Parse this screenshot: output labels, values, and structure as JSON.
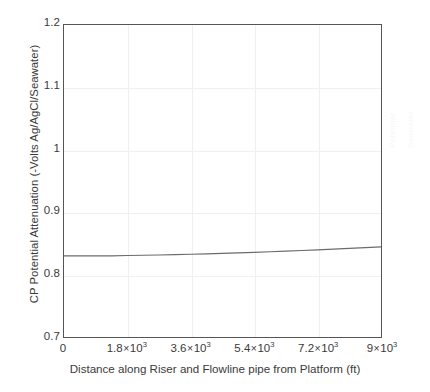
{
  "chart_data": {
    "type": "line",
    "title": "",
    "xlabel": "Distance along Riser and Flowline pipe from Platform (ft)",
    "ylabel": "CP Potential Attenuation (-Volts Ag/AgCl/Seawater)",
    "xlim": [
      0,
      9000
    ],
    "ylim": [
      0.7,
      1.2
    ],
    "grid": true,
    "legend": "none",
    "xticks": [
      0,
      1800,
      3600,
      5400,
      7200,
      9000
    ],
    "xtick_labels": [
      {
        "mantissa": "0",
        "has_exponent": false,
        "exponent": "",
        "value": 0
      },
      {
        "mantissa": "1.8",
        "has_exponent": true,
        "exponent": "3",
        "value": 1800
      },
      {
        "mantissa": "3.6",
        "has_exponent": true,
        "exponent": "3",
        "value": 3600
      },
      {
        "mantissa": "5.4",
        "has_exponent": true,
        "exponent": "3",
        "value": 5400
      },
      {
        "mantissa": "7.2",
        "has_exponent": true,
        "exponent": "3",
        "value": 7200
      },
      {
        "mantissa": "9",
        "has_exponent": true,
        "exponent": "3",
        "value": 9000
      }
    ],
    "yticks": [
      0.7,
      0.8,
      0.9,
      1.0,
      1.1,
      1.2
    ],
    "ytick_labels": [
      "0.7",
      "0.8",
      "0.9",
      "1",
      "1.1",
      "1.2"
    ],
    "series": [
      {
        "name": "CP Potential Attenuation",
        "color": "#6b6b6b",
        "x": [
          0,
          450,
          900,
          1350,
          1800,
          2250,
          2700,
          3150,
          3600,
          4050,
          4500,
          4950,
          5400,
          5850,
          6300,
          6750,
          7200,
          7650,
          8100,
          8550,
          9000
        ],
        "y": [
          0.83,
          0.83,
          0.83,
          0.83,
          0.8305,
          0.831,
          0.8315,
          0.832,
          0.8325,
          0.8332,
          0.834,
          0.8348,
          0.8356,
          0.8366,
          0.8376,
          0.8386,
          0.8397,
          0.8408,
          0.842,
          0.8432,
          0.8445
        ]
      }
    ]
  },
  "axes": {
    "x_title": "Distance along Riser and Flowline pipe from Platform (ft)",
    "y_title": "CP Potential Attenuation (-Volts Ag/AgCl/Seawater)"
  },
  "ghost_text": {
    "column_1": "Potential",
    "column_2": "Seawater"
  }
}
